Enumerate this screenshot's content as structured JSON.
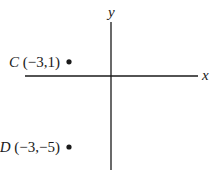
{
  "chart_data": {
    "type": "scatter",
    "title": "",
    "xlabel": "x",
    "ylabel": "y",
    "grid": false,
    "legend": "none",
    "axis_ticks": false,
    "points": [
      {
        "name": "C",
        "x": -3,
        "y": 1,
        "label": "(−3,1)"
      },
      {
        "name": "D",
        "x": -3,
        "y": -5,
        "label": "(−3,−5)"
      }
    ]
  },
  "colors": {
    "ink": "#1a1a1a",
    "background": "#ffffff"
  }
}
